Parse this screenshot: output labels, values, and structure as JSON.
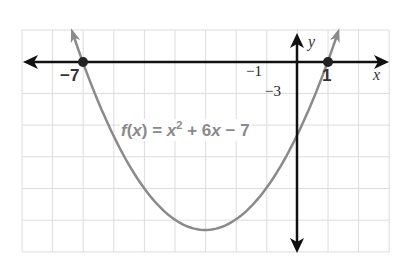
{
  "chart_data": {
    "type": "line",
    "title": "",
    "function_label": "f(x) = x^2 + 6x - 7",
    "function_parts": {
      "f": "f",
      "open": "(",
      "x": "x",
      "close": ")",
      "eq": " = ",
      "x2": "x",
      "exp": "2",
      "rest": " + 6",
      "x3": "x",
      "tail": " − 7"
    },
    "xlabel": "x",
    "ylabel": "y",
    "xlim": [
      -8,
      3
    ],
    "ylim": [
      -18,
      3
    ],
    "x_grid_step": 1,
    "y_grid_step": 3,
    "grid": true,
    "labeled_points": [
      {
        "x": -7,
        "y": 0,
        "label": "−7"
      },
      {
        "x": 1,
        "y": 0,
        "label": "1"
      }
    ],
    "tick_labels": {
      "x": [
        {
          "value": -1,
          "label": "−1"
        }
      ],
      "y": [
        {
          "value": -3,
          "label": "−3"
        }
      ]
    },
    "vertex": {
      "x": -3,
      "y": -16
    },
    "y_intercept": {
      "x": 0,
      "y": -7
    },
    "series": [
      {
        "name": "f(x) = x^2 + 6x - 7",
        "color": "#8a8a8a",
        "x": [
          -7.4,
          -7,
          -6,
          -5,
          -4,
          -3,
          -2,
          -1,
          0,
          1,
          1.4
        ],
        "values": [
          3.36,
          0,
          -7,
          -12,
          -15,
          -16,
          -15,
          -12,
          -7,
          0,
          3.36
        ]
      }
    ],
    "colors": {
      "axis": "#111111",
      "curve": "#8a8a8a",
      "grid": "#dddddd",
      "point": "#222222"
    }
  },
  "labels": {
    "neg7": "−7",
    "one": "1",
    "neg1": "−1",
    "neg3": "−3",
    "x_axis": "x",
    "y_axis": "y"
  }
}
